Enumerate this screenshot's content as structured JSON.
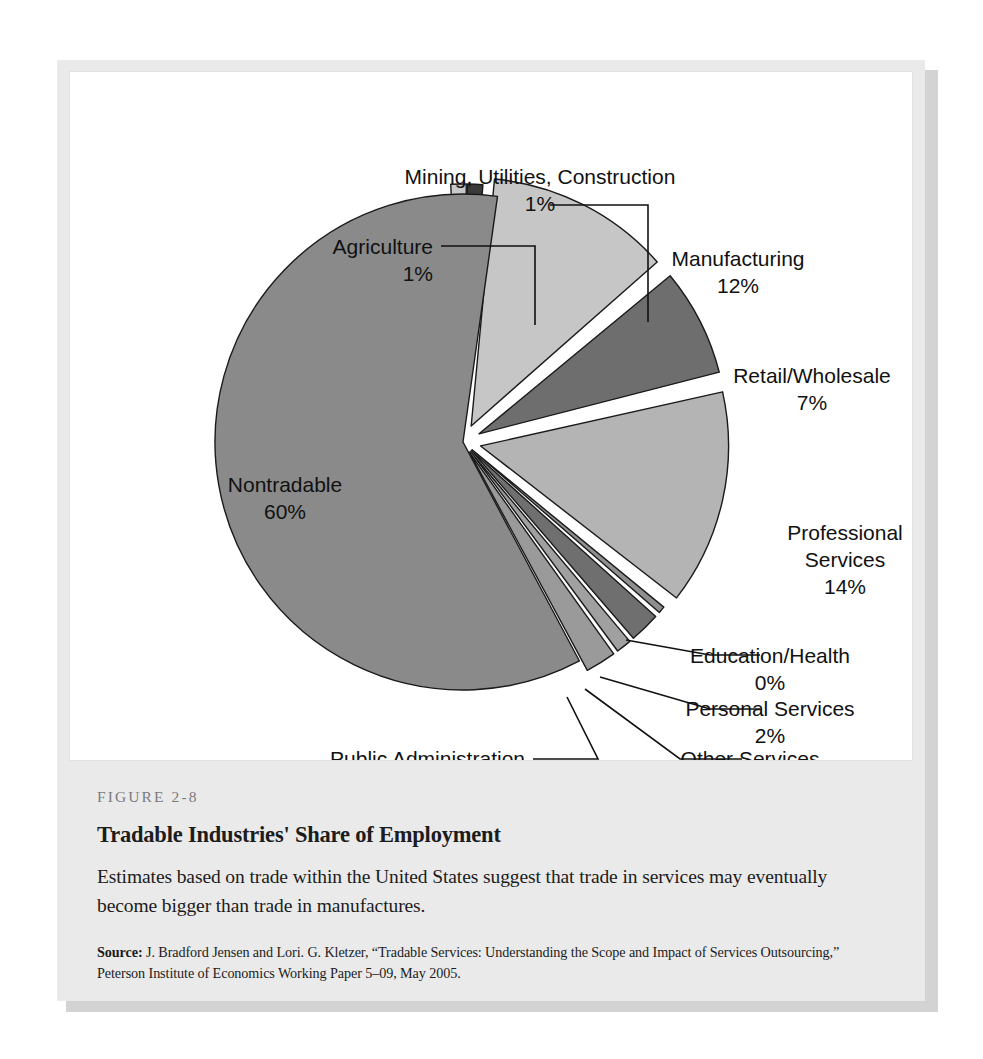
{
  "figure": {
    "number": "FIGURE 2-8",
    "title": "Tradable Industries' Share of Employment",
    "description": "Estimates based on trade within the United States suggest that trade in services may eventually become bigger than trade in manufactures.",
    "source_label": "Source:",
    "source_text": " J. Bradford Jensen and Lori. G. Kletzer, “Tradable Services: Understanding the Scope and Impact of Services Outsourcing,” Peterson Institute of Economics Working Paper 5–09, May 2005."
  },
  "chart_data": {
    "type": "pie",
    "title": "Tradable Industries' Share of Employment",
    "units": "percent of employment",
    "legend": "none (direct labels with leader lines)",
    "total": 100,
    "categories": [
      "Agriculture",
      "Mining, Utilities, Construction",
      "Manufacturing",
      "Retail/Wholesale",
      "Professional Services",
      "Education/Health",
      "Personal Services",
      "Other Services",
      "Public Administration",
      "Nontradable"
    ],
    "values": [
      1,
      1,
      12,
      7,
      14,
      0,
      2,
      1,
      2,
      60
    ],
    "value_labels": [
      "1%",
      "1%",
      "12%",
      "7%",
      "14%",
      "0%",
      "2%",
      "1%",
      "2%",
      "60%"
    ],
    "colors": [
      "#c9c9c9",
      "#3a3a3a",
      "#c6c6c6",
      "#6e6e6e",
      "#b4b4b4",
      "#8f8f8f",
      "#6f6f6f",
      "#a0a0a0",
      "#9a9a9a",
      "#8a8a8a"
    ],
    "exploded": [
      true,
      true,
      true,
      true,
      true,
      true,
      true,
      true,
      true,
      false
    ]
  },
  "slices": [
    {
      "name": "Agriculture",
      "value": 1,
      "value_label": "1%",
      "color": "#c9c9c9",
      "label_lines": [
        "Agriculture",
        "1%"
      ],
      "label_x": 363,
      "label_y": 182,
      "label_anchor": "end",
      "leader": "M 371 174 L 465 174 L 465 253",
      "explode": 10,
      "start": -2.8,
      "sweep": 3.6
    },
    {
      "name": "Mining, Utilities, Construction",
      "value": 1,
      "value_label": "1%",
      "color": "#3a3a3a",
      "label_lines": [
        "Mining, Utilities, Construction",
        "1%"
      ],
      "label_x": 470,
      "label_y": 112,
      "label_anchor": "middle",
      "leader": "M 480 133 L 578 133 L 578 250",
      "explode": 10,
      "start": 0.9,
      "sweep": 3.6
    },
    {
      "name": "Manufacturing",
      "value": 12,
      "value_label": "12%",
      "color": "#c6c6c6",
      "label_lines": [
        "Manufacturing",
        "12%"
      ],
      "label_x": 668,
      "label_y": 194,
      "label_anchor": "middle",
      "leader": "",
      "explode": 18,
      "start": 5.4,
      "sweep": 43.2
    },
    {
      "name": "Retail/Wholesale",
      "value": 7,
      "value_label": "7%",
      "color": "#6e6e6e",
      "label_lines": [
        "Retail/Wholesale",
        "7%"
      ],
      "label_x": 742,
      "label_y": 311,
      "label_anchor": "middle",
      "leader": "",
      "explode": 18,
      "start": 50.4,
      "sweep": 25.2
    },
    {
      "name": "Professional Services",
      "value": 14,
      "value_label": "14%",
      "color": "#b4b4b4",
      "label_lines": [
        "Professional",
        "Services",
        "14%"
      ],
      "label_x": 775,
      "label_y": 468,
      "label_anchor": "middle",
      "leader": "",
      "explode": 18,
      "start": 77.4,
      "sweep": 50.4
    },
    {
      "name": "Education/Health",
      "value": 0,
      "value_label": "0%",
      "color": "#8f8f8f",
      "label_lines": [
        "Education/Health",
        "0%"
      ],
      "label_x": 700,
      "label_y": 591,
      "label_anchor": "middle",
      "leader": "M 556 568 L 640 583 L 690 583",
      "explode": 12,
      "start": 129.4,
      "sweep": 1.6
    },
    {
      "name": "Personal Services",
      "value": 2,
      "value_label": "2%",
      "color": "#6f6f6f",
      "label_lines": [
        "Personal Services",
        "2%"
      ],
      "label_x": 700,
      "label_y": 644,
      "label_anchor": "middle",
      "leader": "M 530 605 L 640 637 L 690 637",
      "explode": 12,
      "start": 132.0,
      "sweep": 7.2
    },
    {
      "name": "Other Services",
      "value": 1,
      "value_label": "1%",
      "color": "#a0a0a0",
      "label_lines": [
        "Other Services",
        "1%"
      ],
      "label_x": 680,
      "label_y": 694,
      "label_anchor": "middle",
      "leader": "M 515 617 L 610 687 L 672 687",
      "explode": 12,
      "start": 140.0,
      "sweep": 3.6
    },
    {
      "name": "Public Administration",
      "value": 2,
      "value_label": "2%",
      "color": "#9a9a9a",
      "label_lines": [
        "Public Administration",
        "2%"
      ],
      "label_x": 455,
      "label_y": 694,
      "label_anchor": "end",
      "leader": "M 497 625 L 528 687 L 463 687",
      "explode": 12,
      "start": 144.4,
      "sweep": 7.2
    },
    {
      "name": "Nontradable",
      "value": 60,
      "value_label": "60%",
      "color": "#8a8a8a",
      "label_lines": [
        "Nontradable",
        "60%"
      ],
      "label_x": 215,
      "label_y": 420,
      "label_anchor": "middle",
      "leader": "",
      "explode": 0,
      "start": 152.0,
      "sweep": 216
    }
  ],
  "bleed_text": {
    "col1": "the interest  of the  wo  h  tion\nsupply  trade  within  tomes  in\nturn  very  unlikely  this\nIf  one  that  world  the  as  the\nmajor  world  that  services  impact  second\nreservations  that  the  U.S.  Services  within\nSurvey  Commerce  the  cost\nmaterials  Services  trade  source  among\nprincipal  industries  occupation  from  Japan  the\nUnited  the  Agreement  and\nthe  countries",
    "col2": "times  is  an  individual\nand  the  year  proportion  is  that  the\ncompany  manufacturing  the  economy  or",
    "col3": "The  yearly  of\nSource  Services\nfigures  cost  high\nU.S.  every  cost  as"
  }
}
